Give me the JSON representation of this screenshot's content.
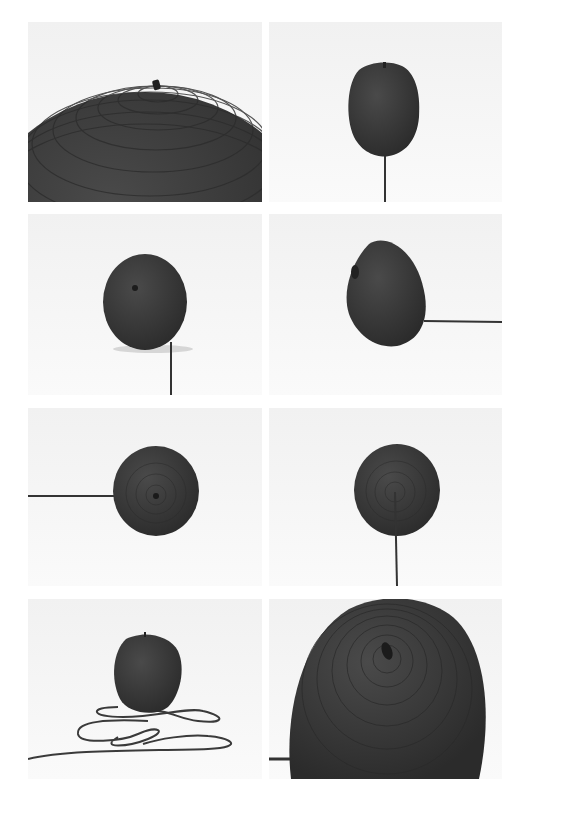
{
  "page": {
    "background": "#ffffff",
    "layout": "photo-grid-2x4"
  },
  "colors": {
    "object": "#3e3e3e",
    "object_dark": "#2e2e2e",
    "backdrop_light": "#f4f4f4",
    "backdrop_mid": "#e9e9e9",
    "cord": "#3a3a3a"
  },
  "photos": [
    {
      "id": "p1",
      "subject": "rope-apple-closeup-top",
      "view": "close-up of top with stem, concentric rope coils"
    },
    {
      "id": "p2",
      "subject": "rope-apple-front",
      "view": "front view, cord running down to floor"
    },
    {
      "id": "p3",
      "subject": "rope-apple-tilted",
      "view": "tilted sphere with stem dimple, cord down right"
    },
    {
      "id": "p4",
      "subject": "rope-apple-side",
      "view": "side view, cord extending right"
    },
    {
      "id": "p5",
      "subject": "rope-apple-wall-left-cord",
      "view": "wall-mounted, cord extending left"
    },
    {
      "id": "p6",
      "subject": "rope-apple-wall-down-cord",
      "view": "wall-mounted, cord hanging down"
    },
    {
      "id": "p7",
      "subject": "rope-apple-with-loops",
      "view": "on floor with looped cord"
    },
    {
      "id": "p8",
      "subject": "rope-apple-closeup-coil",
      "view": "close-up of spiral coils and stem"
    }
  ]
}
